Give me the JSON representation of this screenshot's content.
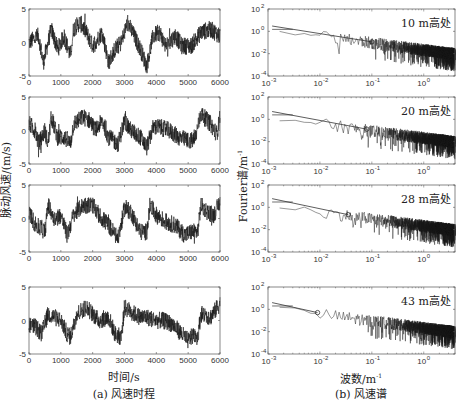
{
  "chart_data": [
    {
      "type": "line",
      "panel": "a",
      "caption": "(a) 风速时程",
      "xlabel": "时间/s",
      "ylabel": "脉动风速/(m/s)",
      "subplots": [
        {
          "id": "a1",
          "height_label": "10 m",
          "xlim": [
            0,
            6000
          ],
          "ylim": [
            -5,
            5
          ],
          "xticks": [
            0,
            1000,
            2000,
            3000,
            4000,
            5000,
            6000
          ],
          "yticks": [
            -5,
            0,
            5
          ],
          "series_trend": [
            [
              0,
              0
            ],
            [
              300,
              1
            ],
            [
              450,
              -3
            ],
            [
              700,
              2
            ],
            [
              900,
              -1
            ],
            [
              1100,
              1
            ],
            [
              1300,
              -2
            ],
            [
              1400,
              2
            ],
            [
              1600,
              3
            ],
            [
              1800,
              1.5
            ],
            [
              2000,
              -0.5
            ],
            [
              2300,
              1.5
            ],
            [
              2500,
              -3
            ],
            [
              2700,
              -1
            ],
            [
              2900,
              0
            ],
            [
              3100,
              3
            ],
            [
              3300,
              1
            ],
            [
              3500,
              -1
            ],
            [
              3700,
              -3.5
            ],
            [
              3900,
              1
            ],
            [
              4100,
              1.5
            ],
            [
              4300,
              -0.5
            ],
            [
              4600,
              1
            ],
            [
              4800,
              -0.5
            ],
            [
              5100,
              -0.5
            ],
            [
              5400,
              1.5
            ],
            [
              5700,
              2
            ],
            [
              6000,
              1
            ]
          ]
        },
        {
          "id": "a2",
          "height_label": "20 m",
          "xlim": [
            0,
            6000
          ],
          "ylim": [
            -5,
            5
          ],
          "xticks": [
            0,
            1000,
            2000,
            3000,
            4000,
            5000,
            6000
          ],
          "yticks": [
            -5,
            0,
            5
          ],
          "series_trend": [
            [
              0,
              1
            ],
            [
              200,
              0
            ],
            [
              300,
              -2
            ],
            [
              500,
              0
            ],
            [
              600,
              -2
            ],
            [
              700,
              2
            ],
            [
              900,
              -1
            ],
            [
              1100,
              -1
            ],
            [
              1300,
              -2
            ],
            [
              1400,
              1
            ],
            [
              1700,
              2
            ],
            [
              1900,
              1.5
            ],
            [
              2100,
              0
            ],
            [
              2300,
              1.5
            ],
            [
              2500,
              -1
            ],
            [
              2800,
              -2
            ],
            [
              3000,
              1.5
            ],
            [
              3200,
              0
            ],
            [
              3500,
              -1
            ],
            [
              3700,
              -2.5
            ],
            [
              3900,
              0.5
            ],
            [
              4100,
              0.5
            ],
            [
              4400,
              0
            ],
            [
              4700,
              -1
            ],
            [
              5000,
              -1.5
            ],
            [
              5200,
              -1.5
            ],
            [
              5400,
              2.5
            ],
            [
              5700,
              1
            ],
            [
              5900,
              -0.5
            ],
            [
              6000,
              2
            ]
          ]
        },
        {
          "id": "a3",
          "height_label": "28 m",
          "xlim": [
            0,
            6000
          ],
          "ylim": [
            -5,
            5
          ],
          "xticks": [
            0,
            1000,
            2000,
            3000,
            4000,
            5000,
            6000
          ],
          "yticks": [
            -5,
            0,
            5
          ],
          "series_trend": [
            [
              0,
              1
            ],
            [
              200,
              -1
            ],
            [
              400,
              -1.5
            ],
            [
              500,
              -2
            ],
            [
              600,
              2
            ],
            [
              800,
              0
            ],
            [
              1000,
              0.5
            ],
            [
              1200,
              -2.5
            ],
            [
              1400,
              0.5
            ],
            [
              1700,
              2
            ],
            [
              2000,
              2
            ],
            [
              2200,
              0.5
            ],
            [
              2500,
              -1
            ],
            [
              2800,
              -3
            ],
            [
              3000,
              1.5
            ],
            [
              3200,
              1
            ],
            [
              3500,
              -2
            ],
            [
              3700,
              -2
            ],
            [
              3800,
              2
            ],
            [
              4000,
              0.5
            ],
            [
              4300,
              -0.5
            ],
            [
              4600,
              -1
            ],
            [
              4900,
              -2.5
            ],
            [
              5100,
              -2
            ],
            [
              5300,
              -2
            ],
            [
              5400,
              2
            ],
            [
              5600,
              1
            ],
            [
              5800,
              0.5
            ],
            [
              6000,
              2.5
            ]
          ]
        },
        {
          "id": "a4",
          "height_label": "43 m",
          "xlim": [
            0,
            6000
          ],
          "ylim": [
            -5,
            5
          ],
          "xticks": [
            0,
            1000,
            2000,
            3000,
            4000,
            5000,
            6000
          ],
          "yticks": [
            -5,
            0,
            5
          ],
          "series_trend": [
            [
              0,
              -0.5
            ],
            [
              200,
              -1
            ],
            [
              400,
              -2
            ],
            [
              600,
              1
            ],
            [
              800,
              0.5
            ],
            [
              1000,
              0
            ],
            [
              1200,
              -2
            ],
            [
              1300,
              -2.5
            ],
            [
              1500,
              1
            ],
            [
              1800,
              2
            ],
            [
              2000,
              1
            ],
            [
              2200,
              0
            ],
            [
              2500,
              0.5
            ],
            [
              2700,
              -2
            ],
            [
              2900,
              -2.5
            ],
            [
              3000,
              2
            ],
            [
              3300,
              1
            ],
            [
              3500,
              0.5
            ],
            [
              3700,
              0.5
            ],
            [
              4000,
              0
            ],
            [
              4200,
              0
            ],
            [
              4500,
              -0.5
            ],
            [
              4800,
              -2
            ],
            [
              5000,
              -3
            ],
            [
              5200,
              -2
            ],
            [
              5300,
              -2.5
            ],
            [
              5400,
              1
            ],
            [
              5700,
              0.5
            ],
            [
              6000,
              2.5
            ]
          ]
        }
      ]
    },
    {
      "type": "line",
      "panel": "b",
      "caption": "(b) 风速谱",
      "xlabel": "波数/m⁻¹",
      "ylabel": "Fourier谱/m⁻¹",
      "xscale": "log",
      "yscale": "log",
      "subplots": [
        {
          "id": "b1",
          "annotation": "10 m高处",
          "xlim": [
            0.001,
            4
          ],
          "ylim": [
            0.0001,
            100
          ],
          "xticks": [
            "10^-3",
            "10^-2",
            "10^-1",
            "10^0"
          ],
          "yticks": [
            "10^-4",
            "10^-2",
            "10^0",
            "10^2"
          ],
          "smooth_start": 3,
          "smooth_end": 0.05,
          "knee_k": 0.1
        },
        {
          "id": "b2",
          "annotation": "20 m高处",
          "xlim": [
            0.001,
            4
          ],
          "ylim": [
            0.0001,
            100
          ],
          "xticks": [
            "10^-3",
            "10^-2",
            "10^-1",
            "10^0"
          ],
          "yticks": [
            "10^-4",
            "10^-2",
            "10^0",
            "10^2"
          ],
          "smooth_start": 5,
          "smooth_end": 0.03,
          "knee_k": 0.08
        },
        {
          "id": "b3",
          "annotation": "28 m高处",
          "xlim": [
            0.001,
            4
          ],
          "ylim": [
            0.0001,
            100
          ],
          "xticks": [
            "10^-3",
            "10^-2",
            "10^-1",
            "10^0"
          ],
          "yticks": [
            "10^-4",
            "10^-2",
            "10^0",
            "10^2"
          ],
          "smooth_start": 6,
          "smooth_end": 0.03,
          "knee_k": 0.035
        },
        {
          "id": "b4",
          "annotation": "43 m高处",
          "xlim": [
            0.001,
            4
          ],
          "ylim": [
            0.0001,
            100
          ],
          "xticks": [
            "10^-3",
            "10^-2",
            "10^-1",
            "10^0"
          ],
          "yticks": [
            "10^-4",
            "10^-2",
            "10^0",
            "10^2"
          ],
          "smooth_start": 4,
          "smooth_end": 0.02,
          "knee_k": 0.009
        }
      ]
    }
  ],
  "labels": {
    "left_ylabel": "脉动风速/(m/s)",
    "left_xlabel": "时间/s",
    "left_caption": "(a) 风速时程",
    "right_ylabel_main": "Fourier谱/m",
    "right_ylabel_sup": "-1",
    "right_xlabel_main": "波数/m",
    "right_xlabel_sup": "-1",
    "right_caption": "(b) 风速谱",
    "annotations": [
      "10 m高处",
      "20 m高处",
      "28 m高处",
      "43 m高处"
    ]
  },
  "ticks": {
    "time": [
      "0",
      "1000",
      "2000",
      "3000",
      "4000",
      "5000",
      "6000"
    ],
    "speed": [
      "5",
      "0",
      "-5"
    ],
    "wave": [
      {
        "base": "10",
        "exp": "-3"
      },
      {
        "base": "10",
        "exp": "-2"
      },
      {
        "base": "10",
        "exp": "-1"
      },
      {
        "base": "10",
        "exp": "0"
      }
    ],
    "spec": [
      {
        "base": "10",
        "exp": "2"
      },
      {
        "base": "10",
        "exp": "0"
      },
      {
        "base": "10",
        "exp": "-2"
      },
      {
        "base": "10",
        "exp": "-4"
      }
    ]
  },
  "colors": {
    "line": "#1a1a1a",
    "axis": "#555555",
    "fit": "#333333"
  }
}
